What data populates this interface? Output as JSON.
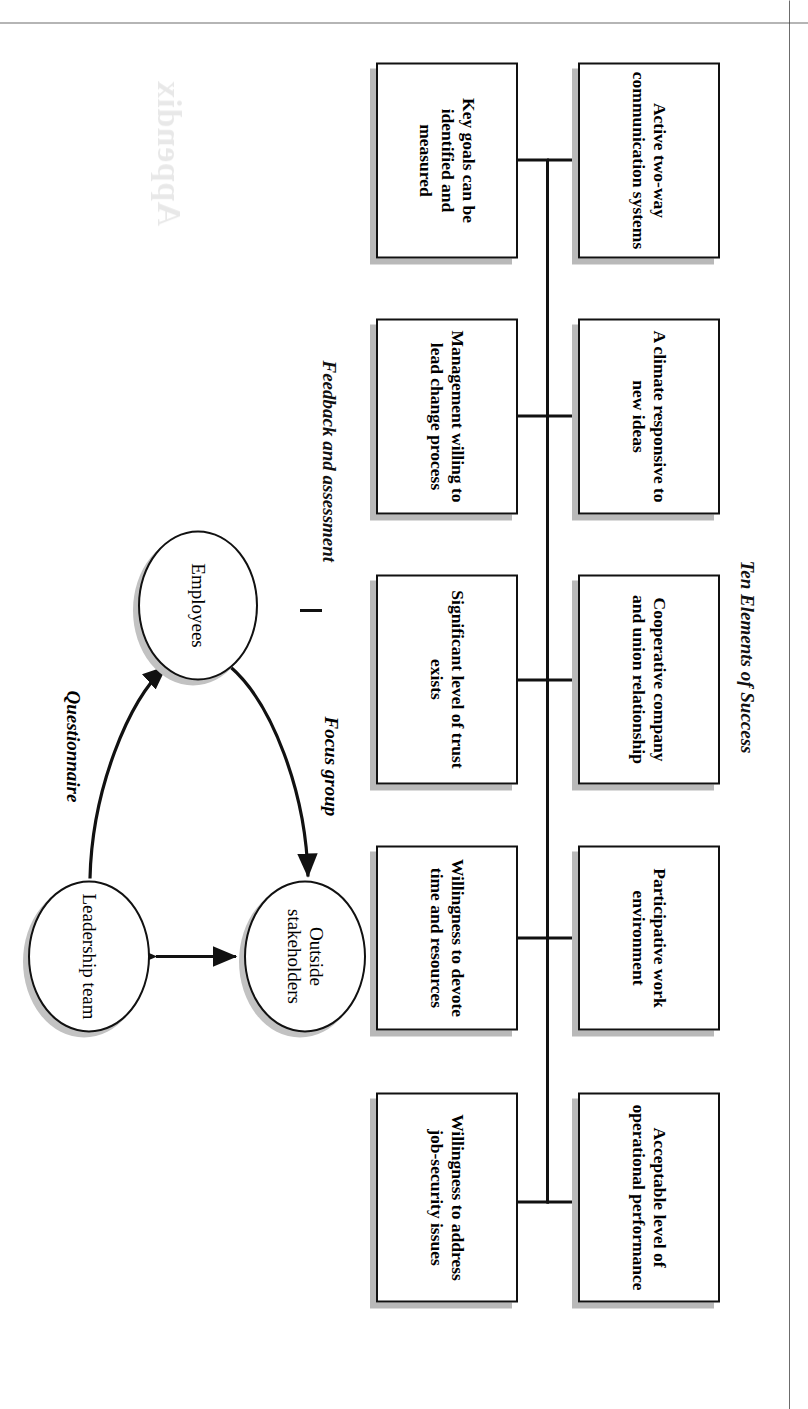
{
  "page": {
    "ghost_heading": "Appendix",
    "folio": ""
  },
  "figure_elements": {
    "title": "Ten Elements of Success",
    "top_row": [
      {
        "label": "Active two-way communication systems"
      },
      {
        "label": "A climate responsive to new ideas"
      },
      {
        "label": "Cooperative company and union relationship"
      },
      {
        "label": "Participative work environment"
      },
      {
        "label": "Acceptable level of operational performance"
      }
    ],
    "bottom_row": [
      {
        "label": "Key goals can be identified and measured"
      },
      {
        "label": "Management willing to lead change process"
      },
      {
        "label": "Significant level of trust exists"
      },
      {
        "label": "Willingness to devote time and resources"
      },
      {
        "label": "Willingness to address job-security issues"
      }
    ]
  },
  "figure_feedback": {
    "title": "Feedback and assessment",
    "nodes": [
      {
        "id": "employees",
        "label": "Employees"
      },
      {
        "id": "leadership",
        "label": "Leadership team"
      },
      {
        "id": "outside",
        "label": "Outside stakeholders"
      }
    ],
    "edges": [
      {
        "label": "Questionnaire",
        "from": "leadership",
        "to": "employees"
      },
      {
        "label": "Focus group",
        "from": "employees",
        "to": "outside"
      },
      {
        "label": "",
        "from": "leadership",
        "to": "outside"
      }
    ]
  },
  "colors": {
    "ink": "#111111",
    "shadow": "#b9b9b9",
    "paper": "#ffffff"
  }
}
